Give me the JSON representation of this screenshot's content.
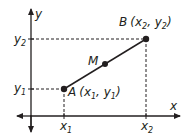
{
  "diagram": {
    "type": "coordinate-plane-midpoint",
    "colors": {
      "stroke": "#231f20",
      "background": "#ffffff"
    },
    "axes": {
      "x_label": "x",
      "y_label": "y"
    },
    "points": {
      "A": {
        "name": "A",
        "coord_label": "(x",
        "sub1": "1",
        "sep": ", y",
        "sub2": "1",
        "close": ")"
      },
      "B": {
        "name": "B",
        "coord_label": "(x",
        "sub1": "2",
        "sep": ", y",
        "sub2": "2",
        "close": ")"
      },
      "M": {
        "name": "M"
      }
    },
    "ticks": {
      "x1": {
        "main": "x",
        "sub": "1"
      },
      "x2": {
        "main": "x",
        "sub": "2"
      },
      "y1": {
        "main": "y",
        "sub": "1"
      },
      "y2": {
        "main": "y",
        "sub": "2"
      }
    }
  }
}
